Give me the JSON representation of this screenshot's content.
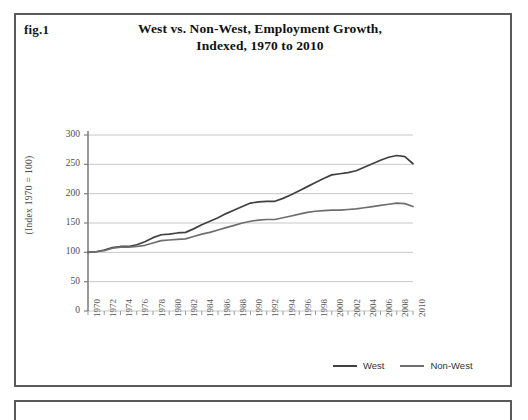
{
  "figure": {
    "label": "fig.1",
    "title_line1": "West vs. Non-West, Employment Growth,",
    "title_line2": "Indexed, 1970 to 2010"
  },
  "legend": {
    "position": "bottom-right",
    "items": [
      {
        "name": "West",
        "color": "#404040"
      },
      {
        "name": "Non-West",
        "color": "#6e6e6e"
      }
    ]
  },
  "chart_data": {
    "type": "line",
    "title": "West vs. Non-West, Employment Growth, Indexed, 1970 to 2010",
    "xlabel": "",
    "ylabel": "(Index 1970 = 100)",
    "ylim": [
      0,
      300
    ],
    "xlim": [
      1970,
      2010
    ],
    "ytick_labels": [
      "0",
      "50",
      "100",
      "150",
      "200",
      "250",
      "300"
    ],
    "yticks": [
      0,
      50,
      100,
      150,
      200,
      250,
      300
    ],
    "xtick_labels": [
      "1970",
      "1972",
      "1974",
      "1976",
      "1978",
      "1980",
      "1982",
      "1984",
      "1986",
      "1988",
      "1990",
      "1992",
      "1994",
      "1996",
      "1998",
      "2000",
      "2002",
      "2004",
      "2006",
      "2008",
      "2010"
    ],
    "xticks": [
      1970,
      1972,
      1974,
      1976,
      1978,
      1980,
      1982,
      1984,
      1986,
      1988,
      1990,
      1992,
      1994,
      1996,
      1998,
      2000,
      2002,
      2004,
      2006,
      2008,
      2010
    ],
    "grid": "horizontal",
    "legend_position": "bottom-right",
    "x": [
      1970,
      1971,
      1972,
      1973,
      1974,
      1975,
      1976,
      1977,
      1978,
      1979,
      1980,
      1981,
      1982,
      1983,
      1984,
      1985,
      1986,
      1987,
      1988,
      1989,
      1990,
      1991,
      1992,
      1993,
      1994,
      1995,
      1996,
      1997,
      1998,
      1999,
      2000,
      2001,
      2002,
      2003,
      2004,
      2005,
      2006,
      2007,
      2008,
      2009,
      2010
    ],
    "series": [
      {
        "name": "West",
        "color": "#404040",
        "values": [
          100,
          101,
          104,
          108,
          110,
          110,
          113,
          118,
          125,
          130,
          131,
          133,
          134,
          140,
          147,
          153,
          159,
          166,
          172,
          178,
          184,
          186,
          187,
          187,
          192,
          198,
          205,
          212,
          219,
          226,
          232,
          234,
          236,
          239,
          245,
          251,
          257,
          262,
          265,
          263,
          251
        ]
      },
      {
        "name": "Non-West",
        "color": "#6e6e6e",
        "values": [
          100,
          101,
          103,
          107,
          109,
          109,
          110,
          112,
          116,
          120,
          121,
          122,
          123,
          127,
          131,
          134,
          138,
          142,
          146,
          150,
          153,
          155,
          156,
          156,
          159,
          162,
          165,
          168,
          170,
          171,
          172,
          172,
          173,
          174,
          176,
          178,
          180,
          182,
          184,
          183,
          178
        ]
      }
    ]
  }
}
